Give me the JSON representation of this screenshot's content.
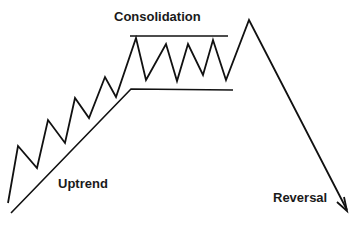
{
  "diagram": {
    "colors": {
      "background": "#ffffff",
      "stroke": "#111111",
      "text": "#1a1a1a"
    },
    "labels": {
      "consolidation": "Consolidation",
      "uptrend": "Uptrend",
      "reversal": "Reversal"
    },
    "price_path_points": "8,203 18,146 37,168 48,120 65,143 75,98 89,118 105,77 116,97 136,38 146,80 166,44 177,81 188,44 203,75 213,40 226,80 249,20 347,210",
    "trend_line_points": "11,213 131,89 233,90",
    "resistance_line": {
      "x1": 130,
      "y1": 36,
      "x2": 228,
      "y2": 36
    },
    "arrow_head_points": "337,202 347,211 344,197"
  }
}
